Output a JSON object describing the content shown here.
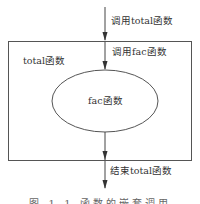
{
  "diagram": {
    "outer_box": {
      "label": "total函数"
    },
    "inner_ellipse": {
      "label": "fac函数"
    },
    "arrows": [
      {
        "label": "调用total函数"
      },
      {
        "label": "调用fac函数"
      },
      {
        "label": "结束total函数"
      }
    ],
    "caption": "图 1-1  函数的嵌套调用",
    "colors": {
      "stroke": "#555555",
      "text": "#333333",
      "background": "#ffffff"
    }
  }
}
